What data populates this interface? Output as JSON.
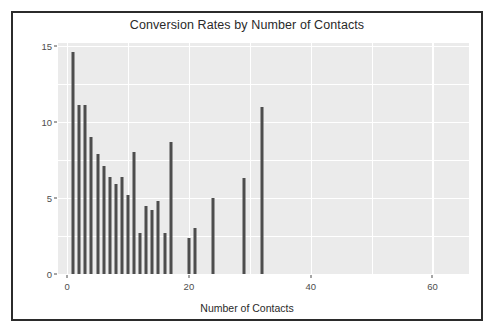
{
  "chart_data": {
    "type": "bar",
    "title": "Conversion Rates by Number of Contacts",
    "xlabel": "Number of Contacts",
    "ylabel": "Conversion Rate (%)",
    "xlim": [
      -1.5,
      66
    ],
    "ylim": [
      0,
      15.2
    ],
    "x_ticks": [
      0,
      20,
      40,
      60
    ],
    "x_tick_labels": [
      "0",
      "20",
      "40",
      "60"
    ],
    "y_ticks": [
      0,
      5,
      10,
      15
    ],
    "y_tick_labels": [
      "0",
      "5",
      "10",
      "15"
    ],
    "x_minor_ticks": [
      10,
      30,
      50
    ],
    "y_minor_ticks": [
      2.5,
      7.5,
      12.5
    ],
    "grid": true,
    "legend": "none",
    "bar_color": "#4d4d4d",
    "panel_color": "#ebebeb",
    "grid_color": "#ffffff",
    "x": [
      1,
      2,
      3,
      4,
      5,
      6,
      7,
      8,
      9,
      10,
      11,
      12,
      13,
      14,
      15,
      16,
      17,
      20,
      21,
      24,
      29,
      32
    ],
    "values": [
      14.6,
      11.1,
      11.1,
      9.0,
      7.9,
      7.1,
      6.4,
      5.9,
      6.4,
      5.2,
      8.0,
      2.7,
      4.5,
      4.2,
      4.8,
      2.7,
      8.7,
      2.4,
      3.0,
      5.0,
      6.3,
      11.0
    ],
    "categories": [
      "1",
      "2",
      "3",
      "4",
      "5",
      "6",
      "7",
      "8",
      "9",
      "10",
      "11",
      "12",
      "13",
      "14",
      "15",
      "16",
      "17",
      "20",
      "21",
      "24",
      "29",
      "32"
    ]
  }
}
